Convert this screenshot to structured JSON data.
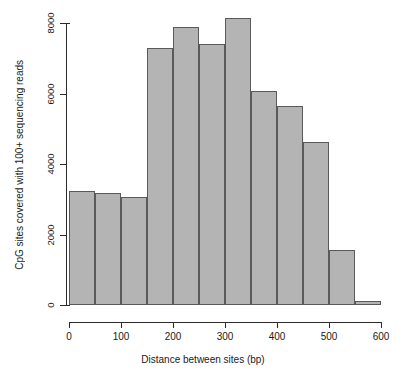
{
  "chart_data": {
    "type": "bar",
    "title": "",
    "subtitle": "",
    "xlabel": "Distance between sites (bp)",
    "ylabel": "CpG sites covered with 100+ sequencing reads",
    "xlim": [
      0,
      600
    ],
    "ylim": [
      0,
      8000
    ],
    "bin_width": 50,
    "grid": false,
    "legend": null,
    "bar_fill_color": "#b4b4b4",
    "bar_border_color": "#5a5a5a",
    "axis_color": "#2b2b2b",
    "background_color": "#ffffff",
    "xticks": [
      0,
      100,
      200,
      300,
      400,
      500,
      600
    ],
    "xtick_labels": [
      "0",
      "100",
      "200",
      "300",
      "400",
      "500",
      "600"
    ],
    "yticks": [
      0,
      2000,
      4000,
      6000,
      8000
    ],
    "ytick_labels": [
      "0",
      "2000",
      "4000",
      "6000",
      "8000"
    ],
    "bins": [
      {
        "x0": 0,
        "x1": 50,
        "value": 3230
      },
      {
        "x0": 50,
        "x1": 100,
        "value": 3180
      },
      {
        "x0": 100,
        "x1": 150,
        "value": 3060
      },
      {
        "x0": 150,
        "x1": 200,
        "value": 7300
      },
      {
        "x0": 200,
        "x1": 250,
        "value": 7900
      },
      {
        "x0": 250,
        "x1": 300,
        "value": 7400
      },
      {
        "x0": 300,
        "x1": 350,
        "value": 8150
      },
      {
        "x0": 350,
        "x1": 400,
        "value": 6080
      },
      {
        "x0": 400,
        "x1": 450,
        "value": 5650
      },
      {
        "x0": 450,
        "x1": 500,
        "value": 4620
      },
      {
        "x0": 500,
        "x1": 550,
        "value": 1550
      },
      {
        "x0": 550,
        "x1": 600,
        "value": 110
      }
    ],
    "categories": [
      "0-50",
      "50-100",
      "100-150",
      "150-200",
      "200-250",
      "250-300",
      "300-350",
      "350-400",
      "400-450",
      "450-500",
      "500-550",
      "550-600"
    ],
    "values": [
      3230,
      3180,
      3060,
      7300,
      7900,
      7400,
      8150,
      6080,
      5650,
      4620,
      1550,
      110
    ]
  }
}
